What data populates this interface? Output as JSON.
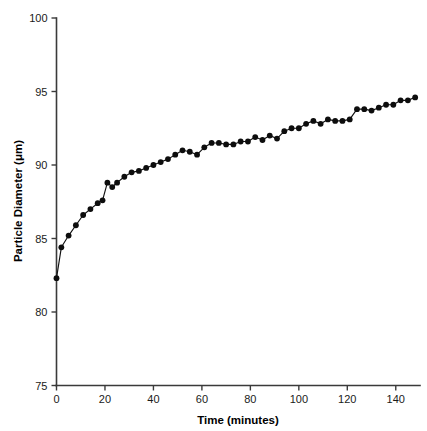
{
  "chart_data": {
    "type": "line",
    "title": "",
    "xlabel": "Time (minutes)",
    "ylabel": "Particle Diameter (μm)",
    "xlim": [
      0,
      150
    ],
    "ylim": [
      75,
      100
    ],
    "xticks": [
      0,
      20,
      40,
      60,
      80,
      100,
      120,
      140
    ],
    "yticks": [
      75,
      80,
      85,
      90,
      95,
      100
    ],
    "xtick_labels": [
      "0",
      "20",
      "40",
      "60",
      "80",
      "100",
      "120",
      "140"
    ],
    "ytick_labels": [
      "75",
      "80",
      "85",
      "90",
      "95",
      "100"
    ],
    "grid": false,
    "legend": false,
    "marker": "filled-circle",
    "line_color": "#111111",
    "marker_color": "#0d0d0d",
    "background_color": "#ffffff",
    "x": [
      0,
      2,
      5,
      8,
      11,
      14,
      17,
      19,
      21,
      23,
      25,
      28,
      31,
      34,
      37,
      40,
      43,
      46,
      49,
      52,
      55,
      58,
      61,
      64,
      67,
      70,
      73,
      76,
      79,
      82,
      85,
      88,
      91,
      94,
      97,
      100,
      103,
      106,
      109,
      112,
      115,
      118,
      121,
      124,
      127,
      130,
      133,
      136,
      139,
      142,
      145,
      148
    ],
    "y": [
      82.3,
      84.4,
      85.2,
      85.9,
      86.6,
      87.0,
      87.4,
      87.6,
      88.8,
      88.5,
      88.8,
      89.2,
      89.5,
      89.6,
      89.8,
      90.0,
      90.2,
      90.4,
      90.7,
      91.0,
      90.9,
      90.7,
      91.2,
      91.5,
      91.5,
      91.4,
      91.4,
      91.6,
      91.6,
      91.9,
      91.7,
      92.0,
      91.8,
      92.3,
      92.5,
      92.5,
      92.8,
      93.0,
      92.8,
      93.1,
      93.0,
      93.0,
      93.1,
      93.8,
      93.8,
      93.7,
      93.9,
      94.1,
      94.1,
      94.4,
      94.4,
      94.6
    ],
    "series_name": "Particle Diameter"
  },
  "axes": {
    "x_title": "Time (minutes)",
    "y_title": "Particle Diameter (μm)"
  }
}
